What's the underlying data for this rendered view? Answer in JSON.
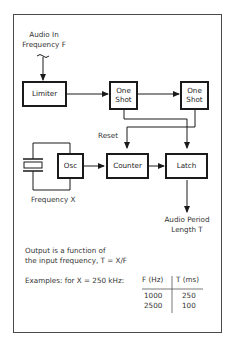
{
  "diagram": {
    "input": {
      "line1": "Audio In",
      "line2": "Frequency F",
      "icon": "ac-signal-tilde-icon"
    },
    "blocks": {
      "limiter": "Limiter",
      "one_shot_1": "One Shot",
      "one_shot_2": "One Shot",
      "osc": "Osc",
      "counter": "Counter",
      "latch": "Latch"
    },
    "labels": {
      "reset": "Reset",
      "crystal_freq": "Frequency X",
      "output_line1": "Audio Period",
      "output_line2": "Length T"
    },
    "crystal_icon": "crystal-oscillator-icon"
  },
  "notes": {
    "line1": "Output is a function of",
    "line2": "the input frequency, T = X/F",
    "examples_label": "Examples: for X = 250 kHz:"
  },
  "table": {
    "headers": [
      "F (Hz)",
      "T (ms)"
    ],
    "rows": [
      [
        "1000",
        "250"
      ],
      [
        "2500",
        "100"
      ]
    ]
  }
}
